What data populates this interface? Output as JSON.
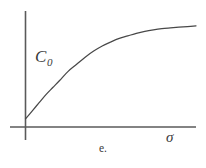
{
  "figure": {
    "caption": "e.",
    "background_color": "#ffffff",
    "line_color": "#484848",
    "axis_color": "#5a5a5a"
  },
  "labels": {
    "curve_label_base": "C",
    "curve_label_subscript": "0",
    "x_axis_label": "σ"
  },
  "chart_data": {
    "type": "line",
    "title": "",
    "subtitle": "",
    "xlabel": "σ",
    "ylabel": "",
    "annotations": [
      {
        "text": "C₀",
        "x": 0.12,
        "y": 0.66,
        "style": "italic-serif",
        "describes": "curve"
      },
      {
        "text": "e.",
        "x": 0.5,
        "y": -0.18,
        "style": "figure-caption"
      }
    ],
    "grid": false,
    "legend": null,
    "axis_ticks": [],
    "xlim": [
      0,
      1
    ],
    "ylim": [
      0,
      1
    ],
    "axes_style": {
      "x_axis_extends_left_of_origin": true,
      "y_axis_extends_below_origin": true,
      "arrowheads": false,
      "ticks": false
    },
    "series": [
      {
        "name": "C₀",
        "description": "saturating exponential approach to plateau",
        "x": [
          0.0,
          0.04,
          0.08,
          0.12,
          0.16,
          0.2,
          0.25,
          0.3,
          0.35,
          0.4,
          0.45,
          0.5,
          0.55,
          0.6,
          0.65,
          0.7,
          0.75,
          0.8,
          0.85,
          0.9,
          0.95,
          1.0
        ],
        "y": [
          0.08,
          0.16,
          0.24,
          0.32,
          0.39,
          0.46,
          0.55,
          0.62,
          0.69,
          0.75,
          0.8,
          0.84,
          0.875,
          0.9,
          0.925,
          0.945,
          0.96,
          0.972,
          0.98,
          0.987,
          0.993,
          1.0
        ]
      }
    ]
  }
}
